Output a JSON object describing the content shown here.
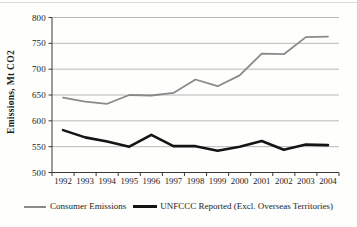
{
  "chart_data": {
    "type": "line",
    "title": "",
    "xlabel": "",
    "ylabel": "Emissions, Mt CO2",
    "ylim": [
      500,
      800
    ],
    "yticks": [
      500,
      550,
      600,
      650,
      700,
      750,
      800
    ],
    "grid": true,
    "legend_position": "bottom",
    "grid_color": "#a6a6a6",
    "axis_color": "#3a3a3a",
    "categories": [
      "1992",
      "1993",
      "1994",
      "1995",
      "1996",
      "1997",
      "1998",
      "1999",
      "2000",
      "2001",
      "2002",
      "2003",
      "2004"
    ],
    "series": [
      {
        "name": "Consumer Emissions",
        "color": "#8a8a8a",
        "width": 1.8,
        "values": [
          645,
          637,
          633,
          650,
          649,
          654,
          680,
          667,
          688,
          730,
          729,
          762,
          763
        ]
      },
      {
        "name": "UNFCCC Reported (Excl. Overseas Territories)",
        "color": "#141414",
        "width": 2.6,
        "values": [
          582,
          568,
          560,
          550,
          573,
          551,
          551,
          542,
          550,
          561,
          544,
          554,
          553
        ]
      }
    ]
  }
}
